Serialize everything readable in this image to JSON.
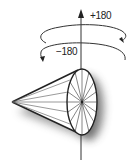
{
  "diagram": {
    "labels": {
      "positive_rotation": "+180",
      "negative_rotation": "−180"
    },
    "colors": {
      "stroke": "#222222",
      "shadow": "#555555",
      "background": "#ffffff"
    },
    "cone": {
      "apex": [
        12,
        102
      ],
      "base_center": [
        82,
        102
      ],
      "base_rx": 15,
      "base_ry": 33,
      "spokes": 14
    },
    "axis": {
      "x": 81,
      "y_top": 10,
      "y_bottom": 160
    }
  }
}
